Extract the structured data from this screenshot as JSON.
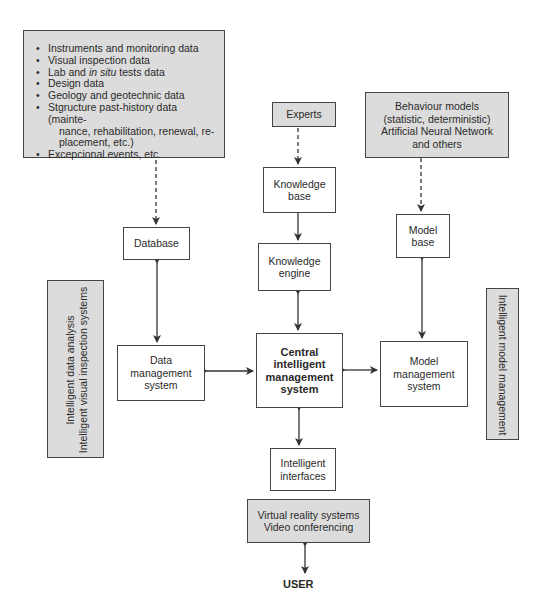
{
  "data_sources": {
    "items": [
      "Instruments and monitoring data",
      "Visual inspection data",
      "Lab and ",
      "Design data",
      "Geology and geotechnic data",
      "Stgructure past-history data (mainte-",
      "Excepcional events, etc."
    ],
    "lab_italic": "in situ",
    "lab_tail": " tests data",
    "history_cont1": "nance, rehabilitation, renewal, re-",
    "history_cont2": "placement, etc.)"
  },
  "experts": "Experts",
  "knowledge_base": [
    "Knowledge",
    "base"
  ],
  "knowledge_engine": [
    "Knowledge",
    "engine"
  ],
  "behaviour_models": [
    "Behaviour models",
    "(statistic, deterministic)",
    "Artificial Neural Network",
    "and others"
  ],
  "model_base": [
    "Model",
    "base"
  ],
  "database": "Database",
  "data_management": [
    "Data",
    "management",
    "system"
  ],
  "central": [
    "Central",
    "intelligent",
    "management",
    "system"
  ],
  "model_management": [
    "Model",
    "management",
    "system"
  ],
  "left_panel": [
    "Intelligent data analysis",
    "Intelligent visual inspection systems"
  ],
  "right_panel": "Intelligent model management",
  "interfaces": [
    "Intelligent",
    "interfaces"
  ],
  "vr_box": [
    "Virtual reality systems",
    "Video conferencing"
  ],
  "user": "USER",
  "colors": {
    "gray_fill": "#dcdcdc",
    "line": "#333333"
  }
}
